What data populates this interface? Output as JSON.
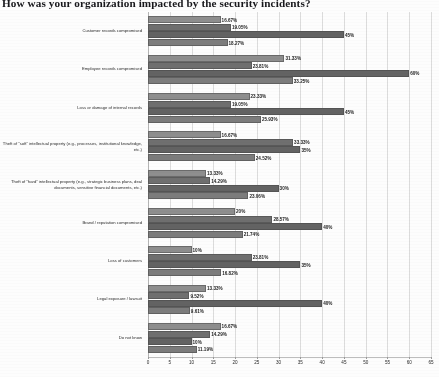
{
  "chart_data": {
    "type": "bar",
    "orientation": "horizontal",
    "title": "How was your organization impacted by the security incidents?",
    "xlabel": "",
    "ylabel": "",
    "xlim": [
      0,
      65
    ],
    "xticks": [
      0,
      5,
      10,
      15,
      20,
      25,
      30,
      35,
      40,
      45,
      50,
      55,
      60,
      65
    ],
    "grid": true,
    "legend": "none",
    "value_suffix": "%",
    "categories": [
      "Customer records compromised",
      "Employee records compromised",
      "Loss or damage of internal records",
      "Theft of \"soft\" intellectual property (e.g., processes, institutional knowledge, etc.)",
      "Theft of \"hard\" intellectual property (e.g., strategic business plans, deal documents, sensitive financial documents, etc.)",
      "Brand / reputation compromised",
      "Loss of customers",
      "Legal exposure / lawsuit",
      "Do not know"
    ],
    "series": [
      {
        "name": "Series 1",
        "color": "#8e8e8e",
        "values": [
          16.67,
          31.33,
          23.33,
          16.67,
          13.33,
          20,
          10,
          13.33,
          16.67
        ],
        "labels": [
          "16.67%",
          "31.33%",
          "23.33%",
          "16.67%",
          "13.33%",
          "20%",
          "10%",
          "13.33%",
          "16.67%"
        ]
      },
      {
        "name": "Series 2",
        "color": "#6f6f6f",
        "values": [
          19.05,
          23.81,
          19.05,
          33.33,
          14.29,
          28.57,
          23.81,
          9.52,
          14.29
        ],
        "labels": [
          "19.05%",
          "23.81%",
          "19.05%",
          "33.33%",
          "14.29%",
          "28.57%",
          "23.81%",
          "9.52%",
          "14.29%"
        ]
      },
      {
        "name": "Series 3",
        "color": "#636363",
        "values": [
          45,
          60,
          45,
          35,
          30,
          40,
          35,
          40,
          10
        ],
        "labels": [
          "45%",
          "60%",
          "45%",
          "35%",
          "30%",
          "40%",
          "35%",
          "40%",
          "10%"
        ]
      },
      {
        "name": "Series 4",
        "color": "#7c7c7c",
        "values": [
          18.27,
          33.25,
          25.93,
          24.52,
          23.06,
          21.74,
          16.82,
          9.61,
          11.19
        ],
        "labels": [
          "18.27%",
          "33.25%",
          "25.93%",
          "24.52%",
          "23.06%",
          "21.74%",
          "16.82%",
          "9.61%",
          "11.19%"
        ]
      }
    ]
  }
}
